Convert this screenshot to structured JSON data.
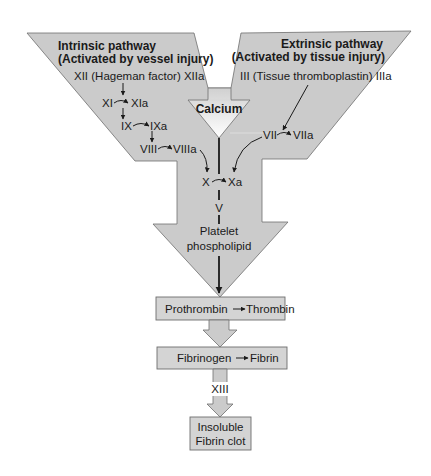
{
  "diagram": {
    "intrinsic": {
      "heading_line1": "Intrinsic pathway",
      "heading_line2": "(Activated by vessel injury)",
      "factor_xii": "XII (Hageman factor) XIIa",
      "factor_xi": "XI",
      "factor_xia": "XIa",
      "factor_ix": "IX",
      "factor_ixa": "IXa",
      "factor_viii": "VIII",
      "factor_viiia": "VIIIa"
    },
    "extrinsic": {
      "heading_line1": "Extrinsic pathway",
      "heading_line2": "(Activated by tissue injury)",
      "factor_iii": "III (Tissue thromboplastin) IIIa",
      "factor_vii": "VII",
      "factor_viia": "VIIa"
    },
    "calcium": {
      "label": "Calcium"
    },
    "common": {
      "factor_x": "X",
      "factor_xa": "Xa",
      "factor_v": "V",
      "platelet_line1": "Platelet",
      "platelet_line2": "phospholipid"
    },
    "steps": {
      "prothrombin": "Prothrombin",
      "thrombin": "Thrombin",
      "fibrinogen": "Fibrinogen",
      "fibrin": "Fibrin",
      "factor_xiii": "XIII",
      "clot_line1": "Insoluble",
      "clot_line2": "Fibrin clot"
    },
    "colors": {
      "shape_fill": "#cbcbcb",
      "box_fill": "#d4d4d4",
      "border": "#6e6e6e",
      "text": "#1a1a1a"
    }
  }
}
